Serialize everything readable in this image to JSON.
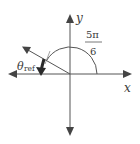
{
  "diagram": {
    "axes": {
      "x_label": "x",
      "y_label": "y"
    },
    "angle": {
      "numerator": "5π",
      "denominator": "6",
      "degrees": 150
    },
    "reference_angle": {
      "symbol": "θ",
      "subscript": "ref"
    },
    "colors": {
      "line": "#555555",
      "text": "#3a3a3a",
      "bold_arrow": "#2a2a2a"
    }
  }
}
